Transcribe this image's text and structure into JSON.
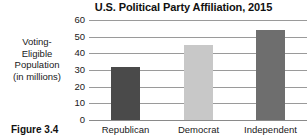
{
  "figure": {
    "caption": "Figure 3.4"
  },
  "chart_data": {
    "type": "bar",
    "title": "U.S. Political Party Affiliation, 2015",
    "xlabel": "",
    "ylabel": "Voting-Eligible Population (in millions)",
    "ylabel_lines": [
      "Voting-",
      "Eligible",
      "Population",
      "(in millions)"
    ],
    "categories": [
      "Republican",
      "Democrat",
      "Independent"
    ],
    "values": [
      32,
      45,
      54
    ],
    "bar_colors": [
      "#4a4a4a",
      "#c8c8c8",
      "#6e6e6e"
    ],
    "ylim": [
      0,
      60
    ],
    "yticks": [
      60,
      50,
      40,
      30,
      20,
      10,
      0
    ],
    "ytick_labels": [
      "60",
      "50",
      "40",
      "30",
      "20",
      "10",
      "0"
    ],
    "grid": true,
    "legend": false,
    "legend_position": "none"
  }
}
